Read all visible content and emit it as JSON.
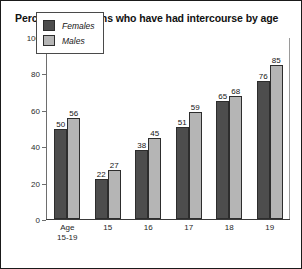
{
  "chart_data": {
    "type": "bar",
    "title": "Percentage of teens who have had intercourse by age",
    "xlabel": "",
    "ylabel": "",
    "ylim": [
      0,
      100
    ],
    "yticks": [
      0,
      20,
      40,
      60,
      80,
      100
    ],
    "grid": false,
    "legend_position": "upper-left-inside",
    "categories": [
      "Age 15-19",
      "15",
      "16",
      "17",
      "18",
      "19"
    ],
    "category_lines": [
      [
        "Age",
        "15-19"
      ],
      [
        "15"
      ],
      [
        "16"
      ],
      [
        "17"
      ],
      [
        "18"
      ],
      [
        "19"
      ]
    ],
    "series": [
      {
        "name": "Females",
        "color": "#4d4d4d",
        "values": [
          50,
          22,
          38,
          51,
          65,
          76
        ]
      },
      {
        "name": "Males",
        "color": "#b5b5b5",
        "values": [
          56,
          27,
          45,
          59,
          68,
          85
        ]
      }
    ]
  },
  "legend": {
    "entries": [
      {
        "label": "Females"
      },
      {
        "label": "Males"
      }
    ]
  },
  "axis": {
    "y_tick_labels": [
      "100",
      "80",
      "60",
      "40",
      "20",
      "0"
    ]
  }
}
